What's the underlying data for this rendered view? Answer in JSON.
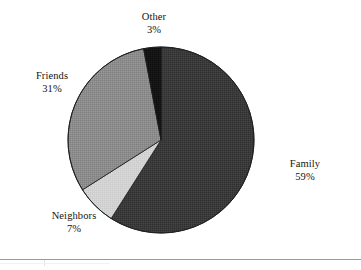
{
  "chart_data": {
    "type": "pie",
    "title": "",
    "subtitle": "",
    "xlabel": "",
    "ylabel": "",
    "legend_position": "none",
    "grid": false,
    "labels_outside": true,
    "start_angle_deg": 0,
    "direction": "clockwise",
    "categories": [
      "Family",
      "Neighbors",
      "Friends",
      "Other"
    ],
    "values": [
      59,
      7,
      31,
      3
    ],
    "value_unit": "percent",
    "slices": [
      {
        "name": "Family",
        "value": 59,
        "label": "Family",
        "percent_label": "59%",
        "color": "#3a3a3a",
        "start_deg": 0,
        "end_deg": 212.4
      },
      {
        "name": "Neighbors",
        "value": 7,
        "label": "Neighbors",
        "percent_label": "7%",
        "color": "#d2d2d2",
        "start_deg": 212.4,
        "end_deg": 237.6
      },
      {
        "name": "Friends",
        "value": 31,
        "label": "Friends",
        "percent_label": "31%",
        "color": "#8c8c8c",
        "start_deg": 237.6,
        "end_deg": 349.2
      },
      {
        "name": "Other",
        "value": 3,
        "label": "Other",
        "percent_label": "3%",
        "color": "#141414",
        "start_deg": 349.2,
        "end_deg": 360
      }
    ]
  },
  "colors": {
    "background": "#ffffff",
    "text": "#141414",
    "family_slice": "#3a3a3a",
    "neighbors_slice": "#d2d2d2",
    "friends_slice": "#8c8c8c",
    "other_slice": "#141414",
    "slice_outline": "#1a1a1a",
    "footer_rule": "#9a9a9a"
  },
  "labels": {
    "other": {
      "name": "Other",
      "percent": "3%"
    },
    "friends": {
      "name": "Friends",
      "percent": "31%"
    },
    "neighbors": {
      "name": "Neighbors",
      "percent": "7%"
    },
    "family": {
      "name": "Family",
      "percent": "59%"
    }
  }
}
